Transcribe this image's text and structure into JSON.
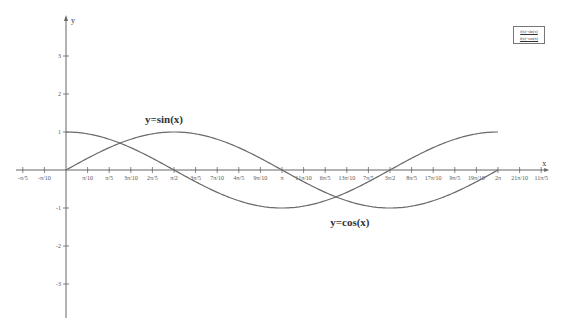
{
  "chart_data": {
    "type": "line",
    "title": "",
    "xlabel": "x",
    "ylabel": "y",
    "xlim": [
      -0.6283,
      6.9115
    ],
    "ylim": [
      -3.5,
      3.5
    ],
    "grid": false,
    "legend_position": "top-right",
    "legend": [
      "f(x)=sin(x)",
      "f(x)=cos(x)"
    ],
    "x_ticks": [
      {
        "label": "-π/5",
        "value": -0.6283
      },
      {
        "label": "-π/10",
        "value": -0.3142
      },
      {
        "label": "π/10",
        "value": 0.3142
      },
      {
        "label": "π/5",
        "value": 0.6283
      },
      {
        "label": "3π/10",
        "value": 0.9425
      },
      {
        "label": "2π/5",
        "value": 1.2566
      },
      {
        "label": "π/2",
        "value": 1.5708
      },
      {
        "label": "3π/5",
        "value": 1.885
      },
      {
        "label": "7π/10",
        "value": 2.1991
      },
      {
        "label": "4π/5",
        "value": 2.5133
      },
      {
        "label": "9π/10",
        "value": 2.8274
      },
      {
        "label": "π",
        "value": 3.1416
      },
      {
        "label": "11π/10",
        "value": 3.4558
      },
      {
        "label": "6π/5",
        "value": 3.7699
      },
      {
        "label": "13π/10",
        "value": 4.0841
      },
      {
        "label": "7π/5",
        "value": 4.3982
      },
      {
        "label": "3π/2",
        "value": 4.7124
      },
      {
        "label": "8π/5",
        "value": 5.0265
      },
      {
        "label": "17π/10",
        "value": 5.3407
      },
      {
        "label": "9π/5",
        "value": 5.6549
      },
      {
        "label": "19π/10",
        "value": 5.969
      },
      {
        "label": "2π",
        "value": 6.2832
      },
      {
        "label": "21π/10",
        "value": 6.5973
      },
      {
        "label": "11π/5",
        "value": 6.9115
      }
    ],
    "y_ticks": [
      {
        "label": "3",
        "value": 3
      },
      {
        "label": "2",
        "value": 2
      },
      {
        "label": "1",
        "value": 1
      },
      {
        "label": "-1",
        "value": -1
      },
      {
        "label": "-2",
        "value": -2
      },
      {
        "label": "-3",
        "value": -3
      }
    ],
    "x": [
      0,
      0.3142,
      0.6283,
      0.9425,
      1.2566,
      1.5708,
      1.885,
      2.1991,
      2.5133,
      2.8274,
      3.1416,
      3.4558,
      3.7699,
      4.0841,
      4.3982,
      4.7124,
      5.0265,
      5.3407,
      5.6549,
      5.969,
      6.2832
    ],
    "series": [
      {
        "name": "y=sin(x)",
        "values": [
          0,
          0.309,
          0.588,
          0.809,
          0.951,
          1,
          0.951,
          0.809,
          0.588,
          0.309,
          0,
          -0.309,
          -0.588,
          -0.809,
          -0.951,
          -1,
          -0.951,
          -0.809,
          -0.588,
          -0.309,
          0
        ]
      },
      {
        "name": "y=cos(x)",
        "values": [
          1,
          0.951,
          0.809,
          0.588,
          0.309,
          0,
          -0.309,
          -0.588,
          -0.809,
          -0.951,
          -1,
          -0.951,
          -0.809,
          -0.588,
          -0.309,
          0,
          0.309,
          0.588,
          0.809,
          0.951,
          1
        ]
      }
    ],
    "annotations": [
      {
        "text": "y=sin(x)",
        "x": 1.5708,
        "y": 1.25
      },
      {
        "text": "y=cos(x)",
        "x": 4.1,
        "y": -1.25
      }
    ]
  },
  "legend": {
    "items": [
      "f(x)=sin(x)",
      "f(x)=cos(x)"
    ]
  },
  "colors": {
    "axis": "#666666",
    "curve": "#6a6a6a",
    "text": "#333333"
  }
}
